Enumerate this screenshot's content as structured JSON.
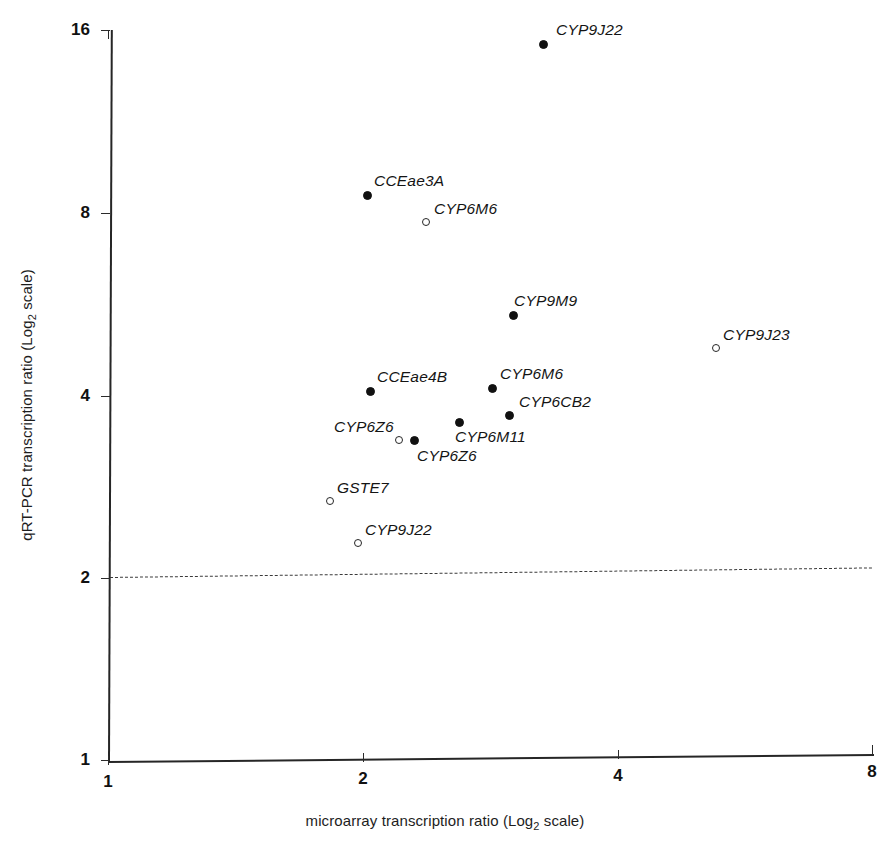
{
  "chart_data": {
    "type": "scatter",
    "title": "",
    "xlabel": "microarray transcription ratio (Log2 scale)",
    "ylabel": "qRT-PCR transcription ratio (Log2 scale)",
    "xlabel_parts": {
      "before": "microarray transcription ratio (Log",
      "sub": "2",
      "after": " scale)"
    },
    "ylabel_parts": {
      "before": "qRT-PCR transcription ratio (Log",
      "sub": "2",
      "after": " scale)"
    },
    "scale": "log2",
    "grid": false,
    "legend": "none",
    "xlim": [
      1,
      8
    ],
    "ylim": [
      1,
      16
    ],
    "xticks": [
      "1",
      "2",
      "4",
      "8"
    ],
    "xtick_values": [
      1,
      2,
      4,
      8
    ],
    "yticks": [
      "1",
      "2",
      "4",
      "8",
      "16"
    ],
    "ytick_values": [
      1,
      2,
      4,
      8,
      16
    ],
    "threshold": {
      "y": 2,
      "style": "dashed",
      "label": ""
    },
    "points": [
      {
        "label": "CYP9J22",
        "x": 3.43,
        "y": 15.5,
        "marker": "filled",
        "px": 543,
        "py": 44,
        "lx": 556,
        "ly": 21
      },
      {
        "label": "CCEae3A",
        "x": 2.1,
        "y": 8.35,
        "marker": "filled",
        "px": 367,
        "py": 195,
        "lx": 374,
        "ly": 172
      },
      {
        "label": "CYP6M6",
        "x": 2.53,
        "y": 7.55,
        "marker": "open",
        "px": 426,
        "py": 222,
        "lx": 434,
        "ly": 200
      },
      {
        "label": "CYP9M9",
        "x": 3.19,
        "y": 5.65,
        "marker": "filled",
        "px": 513,
        "py": 315,
        "lx": 514,
        "ly": 292
      },
      {
        "label": "CYP9J23",
        "x": 5.53,
        "y": 4.95,
        "marker": "open",
        "px": 716,
        "py": 348,
        "lx": 723,
        "ly": 326
      },
      {
        "label": "CCEae4B",
        "x": 2.13,
        "y": 4.1,
        "marker": "filled",
        "px": 370,
        "py": 391,
        "lx": 377,
        "ly": 368
      },
      {
        "label": "CYP6M6",
        "x": 3.08,
        "y": 4.15,
        "marker": "filled",
        "px": 492,
        "py": 388,
        "lx": 500,
        "ly": 365
      },
      {
        "label": "CYP6CB2",
        "x": 3.22,
        "y": 3.8,
        "marker": "filled",
        "px": 509,
        "py": 415,
        "lx": 519,
        "ly": 393
      },
      {
        "label": "CYP6M11",
        "x": 2.81,
        "y": 3.68,
        "marker": "filled",
        "px": 459,
        "py": 422,
        "lx": 455,
        "ly": 428
      },
      {
        "label": "CYP6Z6",
        "x": 2.39,
        "y": 3.45,
        "marker": "open",
        "px": 399,
        "py": 440,
        "lx": 334,
        "ly": 418
      },
      {
        "label": "CYP6Z6",
        "x": 2.47,
        "y": 3.45,
        "marker": "filled",
        "px": 414,
        "py": 440,
        "lx": 417,
        "ly": 447
      },
      {
        "label": "GSTE7",
        "x": 1.83,
        "y": 2.85,
        "marker": "open",
        "px": 330,
        "py": 501,
        "lx": 337,
        "ly": 479
      },
      {
        "label": "CYP9J22",
        "x": 1.97,
        "y": 2.38,
        "marker": "open",
        "px": 358,
        "py": 543,
        "lx": 365,
        "ly": 521
      }
    ]
  },
  "colors": {
    "axis": "#262626",
    "marker_fill": "#111111",
    "marker_open_stroke": "#262626",
    "threshold": "#3a3a3a",
    "background": "#ffffff"
  }
}
